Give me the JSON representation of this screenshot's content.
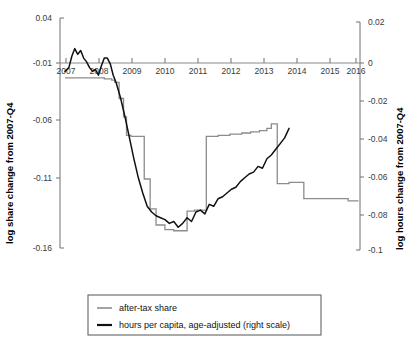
{
  "chart_data": {
    "type": "line",
    "title": "",
    "subtitle": "",
    "xlabel": "",
    "ylabel": "log share change from 2007-Q4",
    "ylabel_right": "log hours change from 2007-Q4",
    "xlim": [
      2006.75,
      2016.9
    ],
    "ylim": [
      -0.16,
      0.04
    ],
    "ylim_right": [
      -0.1,
      0.02
    ],
    "grid": false,
    "legend_position": "bottom-center",
    "xticks": [
      "2007",
      "2008",
      "2009",
      "2010",
      "2011",
      "2012",
      "2013",
      "2014",
      "2015",
      "2016"
    ],
    "xtick_values": [
      2007,
      2008,
      2009,
      2010,
      2011,
      2012,
      2013,
      2014,
      2015,
      2016
    ],
    "yticks_left": [
      "0.04",
      "-0.01",
      "-0.06",
      "-0.11",
      "-0.16"
    ],
    "ytick_values_left": [
      0.04,
      -0.01,
      -0.06,
      -0.11,
      -0.16
    ],
    "yticks_right": [
      "0.02",
      "0",
      "-0.02",
      "-0.04",
      "-0.06",
      "-0.08",
      "-0.1"
    ],
    "ytick_values_right": [
      0.02,
      0,
      -0.02,
      -0.04,
      -0.06,
      -0.08,
      -0.1
    ],
    "zero_line_right": 0,
    "series": [
      {
        "name": "after-tax share",
        "axis": "left",
        "color": "#8c8c8c",
        "style": "step",
        "x": [
          2006.92,
          2007.25,
          2007.5,
          2008.0,
          2008.25,
          2008.5,
          2008.6,
          2008.75,
          2008.9,
          2009.0,
          2009.15,
          2009.3,
          2009.45,
          2009.6,
          2009.8,
          2010.0,
          2010.3,
          2010.6,
          2010.9,
          2011.0,
          2011.05,
          2011.3,
          2011.7,
          2012.1,
          2012.5,
          2012.9,
          2013.2,
          2013.5,
          2013.75,
          2013.9,
          2014.05,
          2014.1,
          2014.5,
          2014.9,
          2014.95,
          2015.0,
          2015.5,
          2016.0,
          2016.4,
          2016.5,
          2016.85
        ],
        "values": [
          -0.012,
          -0.012,
          -0.012,
          -0.012,
          -0.013,
          -0.014,
          -0.016,
          -0.03,
          -0.046,
          -0.062,
          -0.063,
          -0.063,
          -0.063,
          -0.1,
          -0.126,
          -0.14,
          -0.144,
          -0.145,
          -0.145,
          -0.145,
          -0.128,
          -0.127,
          -0.063,
          -0.062,
          -0.061,
          -0.06,
          -0.059,
          -0.058,
          -0.056,
          -0.052,
          -0.052,
          -0.104,
          -0.103,
          -0.103,
          -0.103,
          -0.117,
          -0.117,
          -0.117,
          -0.117,
          -0.119,
          -0.119
        ]
      },
      {
        "name": "hours per capita, age-adjusted (right scale)",
        "axis": "right",
        "color": "#111111",
        "style": "line",
        "x": [
          2006.92,
          2007.05,
          2007.15,
          2007.25,
          2007.35,
          2007.45,
          2007.55,
          2007.65,
          2007.75,
          2007.85,
          2007.95,
          2008.05,
          2008.15,
          2008.25,
          2008.35,
          2008.45,
          2008.55,
          2008.65,
          2008.8,
          2008.95,
          2009.1,
          2009.25,
          2009.4,
          2009.55,
          2009.7,
          2009.85,
          2010.0,
          2010.15,
          2010.3,
          2010.45,
          2010.6,
          2010.75,
          2010.9,
          2011.05,
          2011.2,
          2011.35,
          2011.5,
          2011.65,
          2011.8,
          2011.95,
          2012.1,
          2012.25,
          2012.4,
          2012.55,
          2012.7,
          2012.85,
          2013.0,
          2013.15,
          2013.3,
          2013.45,
          2013.6,
          2013.75,
          2013.9,
          2014.05,
          2014.2,
          2014.35,
          2014.5
        ],
        "values": [
          -0.006,
          -0.004,
          0.002,
          0.006,
          0.003,
          0.005,
          0.001,
          -0.001,
          -0.004,
          -0.006,
          -0.005,
          -0.008,
          -0.003,
          0.001,
          0.001,
          -0.002,
          -0.008,
          -0.012,
          -0.02,
          -0.03,
          -0.041,
          -0.052,
          -0.062,
          -0.07,
          -0.077,
          -0.08,
          -0.082,
          -0.083,
          -0.084,
          -0.086,
          -0.085,
          -0.088,
          -0.086,
          -0.083,
          -0.085,
          -0.08,
          -0.079,
          -0.081,
          -0.076,
          -0.077,
          -0.073,
          -0.072,
          -0.07,
          -0.068,
          -0.067,
          -0.064,
          -0.062,
          -0.06,
          -0.059,
          -0.056,
          -0.057,
          -0.052,
          -0.05,
          -0.047,
          -0.044,
          -0.041,
          -0.036
        ]
      }
    ]
  },
  "legend": {
    "items": [
      {
        "label": "after-tax share",
        "color": "#8c8c8c"
      },
      {
        "label": "hours per capita, age-adjusted (right scale)",
        "color": "#111111"
      }
    ]
  },
  "axes": {
    "left_title": "log share change from 2007-Q4",
    "right_title": "log hours change from 2007-Q4"
  }
}
